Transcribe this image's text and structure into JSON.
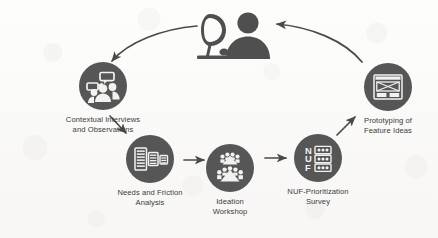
{
  "diagram": {
    "background_color": "#fafaf9",
    "node_fill_color": "#565656",
    "icon_color": "#f2f2f0",
    "arrow_color": "#4a4a4a",
    "label_color": "#3b3b3b"
  },
  "hub": {
    "name": "user-at-computer",
    "icon": "person-with-monitor-icon",
    "label": ""
  },
  "nodes": [
    {
      "id": "contextual-interviews",
      "label": "Contextual Interviews\nand Observations",
      "icon": "video-interview-people-icon",
      "diameter": 48
    },
    {
      "id": "needs-friction-analysis",
      "label": "Needs and Friction\nAnalysis",
      "icon": "documents-analysis-icon",
      "diameter": 48
    },
    {
      "id": "ideation-workshop",
      "label": "Ideation\nWorkshop",
      "icon": "group-brainstorm-icon",
      "diameter": 48
    },
    {
      "id": "nuf-prioritization-survey",
      "label": "NUF-Prioritization\nSurvey",
      "icon": "nuf-rating-chart-icon",
      "diameter": 48,
      "rating_rows": [
        "N",
        "U",
        "F"
      ]
    },
    {
      "id": "prototyping-feature-ideas",
      "label": "Prototyping of\nFeature Ideas",
      "icon": "wireframe-mockup-icon",
      "diameter": 48
    }
  ],
  "connectors": [
    {
      "id": "hub-to-interviews",
      "from": "hub",
      "to": "contextual-interviews",
      "style": "curved-arrow"
    },
    {
      "id": "interviews-to-needs",
      "from": "contextual-interviews",
      "to": "needs-friction-analysis",
      "style": "straight-arrow"
    },
    {
      "id": "needs-to-ideation",
      "from": "needs-friction-analysis",
      "to": "ideation-workshop",
      "style": "straight-arrow"
    },
    {
      "id": "ideation-to-nuf",
      "from": "ideation-workshop",
      "to": "nuf-prioritization-survey",
      "style": "straight-arrow"
    },
    {
      "id": "nuf-to-prototyping",
      "from": "nuf-prioritization-survey",
      "to": "prototyping-feature-ideas",
      "style": "straight-arrow"
    },
    {
      "id": "prototyping-to-hub",
      "from": "prototyping-feature-ideas",
      "to": "hub",
      "style": "curved-arrow"
    }
  ]
}
